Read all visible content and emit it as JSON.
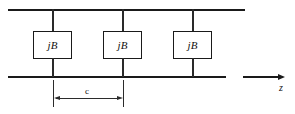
{
  "figure": {
    "colors": {
      "line": "#1a1a1a",
      "background": "#ffffff",
      "text": "#111111"
    },
    "rails": [
      {
        "name": "top-conductor",
        "x": 8,
        "y": 9,
        "width": 237
      },
      {
        "name": "bottom-conductor",
        "x": 8,
        "y": 76,
        "width": 218
      }
    ],
    "elements": [
      {
        "label": "jB",
        "x": 53
      },
      {
        "label": "jB",
        "x": 123
      },
      {
        "label": "jB",
        "x": 193
      }
    ],
    "dimension": {
      "label": "c",
      "from_x": 53,
      "to_x": 123,
      "y": 98
    },
    "axis": {
      "label": "z",
      "segment_x": 243,
      "segment_width": 36,
      "y": 76
    }
  }
}
